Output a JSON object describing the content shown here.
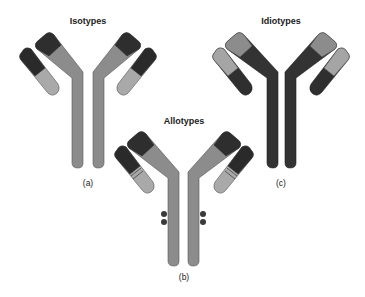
{
  "figure": {
    "panels": [
      {
        "id": "a",
        "title": "Isotypes",
        "label": "(a)",
        "heavy_constant_color": "#8c8c8c",
        "heavy_variable_color": "#2e2e2e",
        "light_constant_color": "#a9a9a9",
        "light_variable_color": "#2a2a2a",
        "notes": "constant regions differ"
      },
      {
        "id": "b",
        "title": "Allotypes",
        "label": "(b)",
        "heavy_constant_color": "#8c8c8c",
        "heavy_variable_color": "#2e2e2e",
        "light_constant_color": "#a9a9a9",
        "light_variable_color": "#2a2a2a",
        "notes": "small allelic differences: bands on light chains and dots on heavy chains"
      },
      {
        "id": "c",
        "title": "Idiotypes",
        "label": "(c)",
        "heavy_constant_color": "#333333",
        "heavy_variable_color": "#8c8c8c",
        "light_constant_color": "#2f2f2f",
        "light_variable_color": "#a5a5a5",
        "notes": "variable regions differ"
      }
    ],
    "colors": {
      "background": "#ffffff",
      "outline": "#555555",
      "dot": "#3a3a3a"
    }
  }
}
